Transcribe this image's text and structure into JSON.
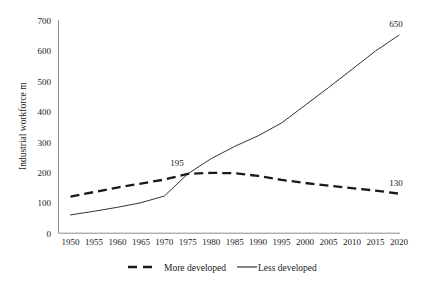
{
  "chart_data": {
    "type": "line",
    "title": "",
    "subtitle": "",
    "xlabel": "",
    "ylabel": "Industrial workforce m",
    "categories": [
      "1950",
      "1955",
      "1960",
      "1965",
      "1970",
      "1975",
      "1980",
      "1985",
      "1990",
      "1995",
      "2000",
      "2005",
      "2010",
      "2015",
      "2020"
    ],
    "x": [
      1950,
      1955,
      1960,
      1965,
      1970,
      1975,
      1980,
      1985,
      1990,
      1995,
      2000,
      2005,
      2010,
      2015,
      2020
    ],
    "xlim": [
      1950,
      2020
    ],
    "ylim": [
      0,
      700
    ],
    "yticks": [
      0,
      100,
      200,
      300,
      400,
      500,
      600,
      700
    ],
    "grid": false,
    "legend_position": "bottom",
    "series": [
      {
        "name": "More developed",
        "style": "dashed",
        "color": "#1a1a1a",
        "values": [
          120,
          135,
          150,
          163,
          176,
          195,
          198,
          197,
          188,
          175,
          165,
          156,
          148,
          140,
          130
        ]
      },
      {
        "name": "Less developed",
        "style": "solid",
        "color": "#333333",
        "values": [
          60,
          72,
          85,
          100,
          122,
          195,
          245,
          285,
          320,
          362,
          420,
          478,
          538,
          598,
          650
        ]
      }
    ],
    "annotations": [
      {
        "text": "195",
        "x": 1975,
        "y": 195,
        "series": "crossing"
      },
      {
        "text": "650",
        "x": 2020,
        "y": 650,
        "series": "Less developed"
      },
      {
        "text": "130",
        "x": 2020,
        "y": 130,
        "series": "More developed"
      }
    ]
  },
  "axes": {
    "y_title": "Industrial workforce m",
    "y_ticks": [
      "700",
      "600",
      "500",
      "400",
      "300",
      "200",
      "100",
      "0"
    ],
    "x_ticks": [
      "1950",
      "1955",
      "1960",
      "1965",
      "1970",
      "1975",
      "1980",
      "1985",
      "1990",
      "1995",
      "2000",
      "2005",
      "2010",
      "2015",
      "2020"
    ]
  },
  "legend": {
    "items": [
      {
        "label": "More developed",
        "style": "dashed"
      },
      {
        "label": "Less developed",
        "style": "solid"
      }
    ]
  },
  "annotations": {
    "peak_more": "195",
    "end_less": "650",
    "end_more": "130"
  }
}
